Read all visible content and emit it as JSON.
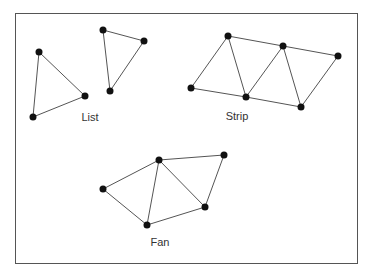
{
  "diagram": {
    "colors": {
      "edge": "#555555",
      "vertex": "#111111",
      "frame": "#555555",
      "background": "#ffffff"
    },
    "groups": [
      {
        "name": "list",
        "label": "List",
        "label_pos": [
          90,
          117
        ],
        "vertices": [
          [
            39,
            52
          ],
          [
            85,
            96
          ],
          [
            33,
            117
          ],
          [
            103,
            30
          ],
          [
            144,
            41
          ],
          [
            110,
            91
          ]
        ],
        "edges": [
          [
            0,
            1
          ],
          [
            1,
            2
          ],
          [
            2,
            0
          ],
          [
            3,
            4
          ],
          [
            4,
            5
          ],
          [
            5,
            3
          ]
        ]
      },
      {
        "name": "strip",
        "label": "Strip",
        "label_pos": [
          237,
          116
        ],
        "vertices": [
          [
            191,
            88
          ],
          [
            228,
            36
          ],
          [
            246,
            97
          ],
          [
            283,
            46
          ],
          [
            301,
            107
          ],
          [
            338,
            56
          ]
        ],
        "edges": [
          [
            0,
            1
          ],
          [
            0,
            2
          ],
          [
            1,
            2
          ],
          [
            1,
            3
          ],
          [
            2,
            3
          ],
          [
            2,
            4
          ],
          [
            3,
            4
          ],
          [
            3,
            5
          ],
          [
            4,
            5
          ]
        ]
      },
      {
        "name": "fan",
        "label": "Fan",
        "label_pos": [
          160,
          242
        ],
        "vertices": [
          [
            159,
            160
          ],
          [
            103,
            189
          ],
          [
            147,
            225
          ],
          [
            205,
            207
          ],
          [
            224,
            155
          ]
        ],
        "edges": [
          [
            0,
            1
          ],
          [
            0,
            2
          ],
          [
            0,
            3
          ],
          [
            0,
            4
          ],
          [
            1,
            2
          ],
          [
            2,
            3
          ],
          [
            3,
            4
          ]
        ]
      }
    ]
  }
}
